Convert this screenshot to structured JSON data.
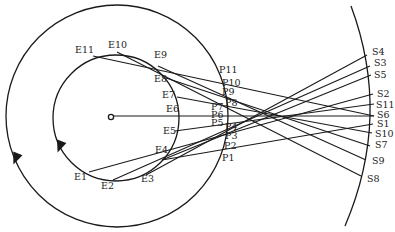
{
  "diagram": {
    "colors": {
      "stroke": "#1a1a1a",
      "background": "#ffffff",
      "text": "#222222"
    },
    "outer_circle": {
      "cx": 117,
      "cy": 116,
      "r": 111
    },
    "inner_circle": {
      "cx": 116,
      "cy": 118,
      "r": 63
    },
    "center_point": {
      "x": 111,
      "y": 117,
      "r": 2.6
    },
    "center_line": {
      "x1": 114,
      "y1": 116,
      "x2": 374,
      "y2": 116
    },
    "screen_arc": {
      "path": "M351,6 Q392,116 345,226"
    },
    "arrows": [
      {
        "name": "inner-circle-arrow",
        "x": 60,
        "y": 146,
        "angle": 110
      },
      {
        "name": "outer-circle-arrow",
        "x": 16,
        "y": 158,
        "angle": 112
      }
    ],
    "e_points": [
      {
        "label": "E1",
        "x": 89,
        "y": 172,
        "lx": 74,
        "ly": 180
      },
      {
        "label": "E2",
        "x": 113,
        "y": 180,
        "lx": 101,
        "ly": 189
      },
      {
        "label": "E3",
        "x": 146,
        "y": 175,
        "lx": 141,
        "ly": 182
      },
      {
        "label": "E4",
        "x": 162,
        "y": 160,
        "lx": 155,
        "ly": 153
      },
      {
        "label": "E5",
        "x": 175,
        "y": 131,
        "lx": 163,
        "ly": 134
      },
      {
        "label": "E6",
        "x": 179,
        "y": 116,
        "lx": 166,
        "ly": 112
      },
      {
        "label": "E7",
        "x": 177,
        "y": 97,
        "lx": 162,
        "ly": 98
      },
      {
        "label": "E8",
        "x": 166,
        "y": 78,
        "lx": 154,
        "ly": 82
      },
      {
        "label": "E9",
        "x": 158,
        "y": 66,
        "lx": 154,
        "ly": 58
      },
      {
        "label": "E10",
        "x": 117,
        "y": 52,
        "lx": 108,
        "ly": 48
      },
      {
        "label": "E11",
        "x": 93,
        "y": 56,
        "lx": 75,
        "ly": 53
      }
    ],
    "p_labels": [
      {
        "label": "P11",
        "x": 219,
        "y": 73
      },
      {
        "label": "P10",
        "x": 222,
        "y": 86
      },
      {
        "label": "P9",
        "x": 222,
        "y": 95
      },
      {
        "label": "P8",
        "x": 225,
        "y": 106
      },
      {
        "label": "P7",
        "x": 211,
        "y": 110
      },
      {
        "label": "P6",
        "x": 211,
        "y": 118
      },
      {
        "label": "P5",
        "x": 211,
        "y": 126
      },
      {
        "label": "P4",
        "x": 225,
        "y": 130
      },
      {
        "label": "P3",
        "x": 225,
        "y": 139
      },
      {
        "label": "P2",
        "x": 224,
        "y": 149
      },
      {
        "label": "P1",
        "x": 222,
        "y": 161
      }
    ],
    "s_points": [
      {
        "label": "S4",
        "x": 367,
        "y": 55,
        "lx": 372,
        "ly": 55
      },
      {
        "label": "S3",
        "x": 370,
        "y": 66,
        "lx": 374,
        "ly": 66
      },
      {
        "label": "S5",
        "x": 371,
        "y": 75,
        "lx": 374,
        "ly": 78
      },
      {
        "label": "S2",
        "x": 373,
        "y": 94,
        "lx": 377,
        "ly": 97
      },
      {
        "label": "S11",
        "x": 374,
        "y": 104,
        "lx": 376,
        "ly": 108
      },
      {
        "label": "S6",
        "x": 374,
        "y": 116,
        "lx": 377,
        "ly": 118
      },
      {
        "label": "S1",
        "x": 373,
        "y": 124,
        "lx": 377,
        "ly": 127
      },
      {
        "label": "S10",
        "x": 372,
        "y": 133,
        "lx": 375,
        "ly": 137
      },
      {
        "label": "S7",
        "x": 370,
        "y": 146,
        "lx": 375,
        "ly": 148
      },
      {
        "label": "S9",
        "x": 366,
        "y": 160,
        "lx": 372,
        "ly": 164
      },
      {
        "label": "S8",
        "x": 361,
        "y": 176,
        "lx": 367,
        "ly": 182
      }
    ],
    "rays": [
      {
        "from": "E1",
        "to": "S2"
      },
      {
        "from": "E2",
        "to": "S3"
      },
      {
        "from": "E3",
        "to": "S4"
      },
      {
        "from": "E4",
        "to": "S5"
      },
      {
        "from": "E4",
        "to": "S1"
      },
      {
        "from": "E5",
        "to": "S11"
      },
      {
        "from": "E7",
        "to": "S10"
      },
      {
        "from": "E8",
        "to": "S7"
      },
      {
        "from": "E9",
        "to": "S9"
      },
      {
        "from": "E10",
        "to": "S8"
      },
      {
        "from": "E11",
        "to": "S6"
      }
    ]
  }
}
